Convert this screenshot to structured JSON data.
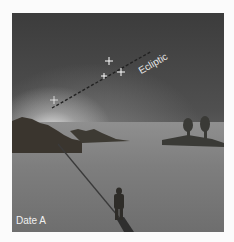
{
  "image": {
    "description": "Twilight sky scene with dashed ecliptic line rising from horizon glow, stars along it, hills, trees, and a person standing on a snowy plain casting a shadow",
    "labels": {
      "ecliptic": "Ecliptic",
      "date": "Date A"
    },
    "colors": {
      "sky_dark": "#3c3c3c",
      "glow": "#ebebeb",
      "ground": "#8a8a8a",
      "hills": "#3a352e",
      "label": "#e6e6e6"
    }
  }
}
